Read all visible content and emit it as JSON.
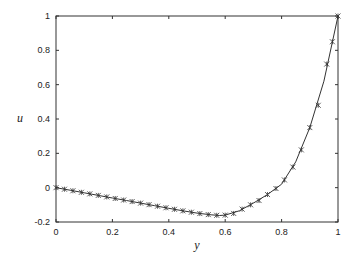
{
  "chart_data": {
    "type": "line",
    "title": "",
    "xlabel": "y",
    "ylabel": "u",
    "xlim": [
      0,
      1
    ],
    "ylim": [
      -0.2,
      1
    ],
    "xticks": [
      "0",
      "0.2",
      "0.4",
      "0.6",
      "0.8",
      "1"
    ],
    "yticks": [
      "-0.2",
      "0",
      "0.2",
      "0.4",
      "0.6",
      "0.8",
      "1"
    ],
    "grid": false,
    "legend": null,
    "series": [
      {
        "name": "solution (line)",
        "style": "solid line",
        "x": [
          0,
          0.05,
          0.1,
          0.15,
          0.2,
          0.25,
          0.3,
          0.35,
          0.4,
          0.45,
          0.5,
          0.55,
          0.58,
          0.6,
          0.65,
          0.7,
          0.75,
          0.8,
          0.85,
          0.9,
          0.95,
          1.0
        ],
        "values": [
          0,
          -0.015,
          -0.03,
          -0.045,
          -0.06,
          -0.075,
          -0.09,
          -0.105,
          -0.12,
          -0.135,
          -0.148,
          -0.158,
          -0.162,
          -0.16,
          -0.135,
          -0.09,
          -0.04,
          0.02,
          0.15,
          0.35,
          0.62,
          1.0
        ]
      },
      {
        "name": "solution (markers)",
        "style": "x-plus markers",
        "x": [
          0,
          0.03,
          0.06,
          0.09,
          0.12,
          0.15,
          0.18,
          0.21,
          0.24,
          0.27,
          0.3,
          0.33,
          0.36,
          0.39,
          0.42,
          0.45,
          0.48,
          0.51,
          0.54,
          0.57,
          0.6,
          0.63,
          0.66,
          0.69,
          0.72,
          0.75,
          0.78,
          0.81,
          0.84,
          0.87,
          0.9,
          0.93,
          0.96,
          0.98,
          1.0
        ],
        "values": [
          0,
          -0.009,
          -0.018,
          -0.027,
          -0.036,
          -0.045,
          -0.054,
          -0.063,
          -0.072,
          -0.081,
          -0.09,
          -0.099,
          -0.108,
          -0.117,
          -0.126,
          -0.135,
          -0.143,
          -0.151,
          -0.157,
          -0.161,
          -0.16,
          -0.15,
          -0.125,
          -0.1,
          -0.075,
          -0.04,
          -0.005,
          0.045,
          0.12,
          0.22,
          0.35,
          0.48,
          0.72,
          0.85,
          1.0
        ]
      }
    ]
  },
  "axes": {
    "xlabel": "y",
    "ylabel": "u",
    "xticks": [
      "0",
      "0.2",
      "0.4",
      "0.6",
      "0.8",
      "1"
    ],
    "yticks": [
      "1",
      "0.8",
      "0.6",
      "0.4",
      "0.2",
      "0",
      "-0.2"
    ]
  }
}
